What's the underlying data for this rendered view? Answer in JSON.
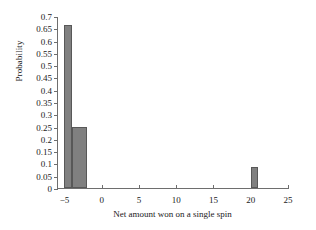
{
  "chart_data": {
    "type": "bar",
    "title": "",
    "xlabel": "Net amount won on a single spin",
    "ylabel": "Probability",
    "xlim": [
      -6,
      25
    ],
    "ylim": [
      0,
      0.7
    ],
    "grid": false,
    "legend": false,
    "bar_color": "#808080",
    "bar_edge_color": "#585858",
    "axis_color": "#6e6e6e",
    "background": "#ffffff",
    "xticks": [
      -5,
      0,
      5,
      10,
      15,
      20,
      25
    ],
    "xtick_labels": [
      "−5",
      "0",
      "5",
      "10",
      "15",
      "20",
      "25"
    ],
    "yticks": [
      0,
      0.05,
      0.1,
      0.15,
      0.2,
      0.25,
      0.3,
      0.35,
      0.4,
      0.45,
      0.5,
      0.55,
      0.6,
      0.65,
      0.7
    ],
    "ytick_labels": [
      "0",
      "0.05",
      "0.1",
      "0.15",
      "0.2",
      "0.25",
      "0.3",
      "0.35",
      "0.4",
      "0.45",
      "0.5",
      "0.55",
      "0.6",
      "0.65",
      "0.7"
    ],
    "bars": [
      {
        "label": "-5 to -4",
        "x_start": -5,
        "x_end": -4,
        "value": 0.665
      },
      {
        "label": "-4 to -2",
        "x_start": -4,
        "x_end": -2,
        "value": 0.25
      },
      {
        "label": "20 to 21",
        "x_start": 20,
        "x_end": 21,
        "value": 0.085
      }
    ],
    "categories": [
      "-5 to -4",
      "-4 to -2",
      "20 to 21"
    ],
    "values": [
      0.665,
      0.25,
      0.085
    ]
  }
}
